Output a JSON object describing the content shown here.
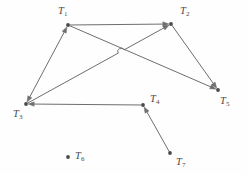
{
  "figure": {
    "type": "directed-graph",
    "width": 247,
    "height": 174,
    "background_color": "#fefefe",
    "edge_color": "#6e6e6e",
    "node_color": "#4a4a4a",
    "label_color": "#4a4a4a"
  },
  "nodes": [
    {
      "id": "T1",
      "letter": "T",
      "sub": "1",
      "x": 68,
      "y": 25,
      "label_x": 58,
      "label_y": 6,
      "isolated": false
    },
    {
      "id": "T2",
      "letter": "T",
      "sub": "2",
      "x": 171,
      "y": 24,
      "label_x": 180,
      "label_y": 6,
      "isolated": false
    },
    {
      "id": "T3",
      "letter": "T",
      "sub": "3",
      "x": 26,
      "y": 104,
      "label_x": 13,
      "label_y": 109,
      "isolated": false
    },
    {
      "id": "T4",
      "letter": "T",
      "sub": "4",
      "x": 143,
      "y": 105,
      "label_x": 150,
      "label_y": 94,
      "isolated": false
    },
    {
      "id": "T5",
      "letter": "T",
      "sub": "5",
      "x": 218,
      "y": 90,
      "label_x": 220,
      "label_y": 96,
      "isolated": false
    },
    {
      "id": "T6",
      "letter": "T",
      "sub": "6",
      "x": 68,
      "y": 157,
      "label_x": 75,
      "label_y": 151,
      "isolated": true
    },
    {
      "id": "T7",
      "letter": "T",
      "sub": "7",
      "x": 170,
      "y": 153,
      "label_x": 176,
      "label_y": 157,
      "isolated": false
    }
  ],
  "edges": [
    {
      "from": "T1",
      "to": "T2",
      "arrow": "forward",
      "crossing_hop": false
    },
    {
      "from": "T1",
      "to": "T3",
      "arrow": "bidirectional",
      "crossing_hop": false
    },
    {
      "from": "T1",
      "to": "T5",
      "arrow": "forward",
      "crossing_hop": false
    },
    {
      "from": "T3",
      "to": "T2",
      "arrow": "forward",
      "crossing_hop": true
    },
    {
      "from": "T2",
      "to": "T5",
      "arrow": "forward",
      "crossing_hop": false
    },
    {
      "from": "T4",
      "to": "T3",
      "arrow": "forward",
      "crossing_hop": false
    },
    {
      "from": "T7",
      "to": "T4",
      "arrow": "forward",
      "crossing_hop": false
    }
  ],
  "crossing": {
    "x": 122,
    "y": 53,
    "description": "edge T3-T2 hops over edge T1-T5"
  }
}
